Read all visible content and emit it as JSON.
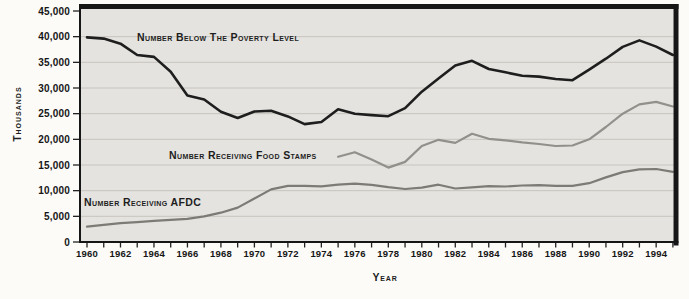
{
  "figure": {
    "background": "#fcfbf8",
    "plot_background": "#e4e3df",
    "grid_color": "#c7c4bd",
    "frame_color": "#161616",
    "tick_color": "#222222"
  },
  "chart_data": {
    "type": "line",
    "title": "",
    "xlabel": "Year",
    "ylabel": "Thousands",
    "xlim": [
      1959.5,
      1995
    ],
    "ylim": [
      0,
      45000
    ],
    "grid": "horizontal",
    "legend_position": "inline-annotations",
    "y_ticks": [
      0,
      5000,
      10000,
      15000,
      20000,
      25000,
      30000,
      35000,
      40000,
      45000
    ],
    "y_tick_labels": [
      "0",
      "5,000",
      "10,000",
      "15,000",
      "20,000",
      "25,000",
      "30,000",
      "35,000",
      "40,000",
      "45,000"
    ],
    "x_tick_years_labeled": [
      1960,
      1962,
      1964,
      1966,
      1968,
      1970,
      1972,
      1974,
      1976,
      1978,
      1980,
      1982,
      1984,
      1986,
      1988,
      1990,
      1992,
      1994
    ],
    "x_tick_labels": [
      "1960",
      "1962",
      "1964",
      "1966",
      "1968",
      "1970",
      "1972",
      "1974",
      "1976",
      "1978",
      "1980",
      "1982",
      "1984",
      "1986",
      "1988",
      "1990",
      "1992",
      "1994"
    ],
    "x_minor_tick_every_year": true,
    "series": [
      {
        "name": "poverty",
        "label": "Number Below The Poverty Level",
        "color": "#1e1e1e",
        "width": 2.6,
        "start_year": 1960,
        "values": [
          39851,
          39628,
          38625,
          36436,
          36055,
          33185,
          28510,
          27769,
          25389,
          24147,
          25420,
          25559,
          24460,
          22973,
          23370,
          25877,
          24975,
          24720,
          24497,
          26072,
          29272,
          31822,
          34398,
          35303,
          33700,
          33064,
          32370,
          32221,
          31745,
          31528,
          33585,
          35708,
          38014,
          39265,
          38059,
          36425
        ]
      },
      {
        "name": "food-stamps",
        "label": "Number Receiving Food Stamps",
        "color": "#92908b",
        "width": 2.2,
        "start_year": 1975,
        "values": [
          16600,
          17500,
          16100,
          14500,
          15600,
          18700,
          19900,
          19300,
          21100,
          20100,
          19800,
          19400,
          19100,
          18700,
          18800,
          20000,
          22400,
          25000,
          26800,
          27300,
          26400
        ]
      },
      {
        "name": "afdc",
        "label": "Number Receiving AFDC",
        "color": "#7d7b76",
        "width": 2.2,
        "start_year": 1960,
        "values": [
          3005,
          3354,
          3676,
          3876,
          4118,
          4329,
          4513,
          5014,
          5705,
          6706,
          8466,
          10241,
          10947,
          10949,
          10845,
          11165,
          11386,
          11130,
          10672,
          10318,
          10597,
          11160,
          10431,
          10659,
          10866,
          10813,
          10997,
          11065,
          10920,
          10934,
          11460,
          12592,
          13625,
          14143,
          14226,
          13652
        ]
      }
    ]
  }
}
